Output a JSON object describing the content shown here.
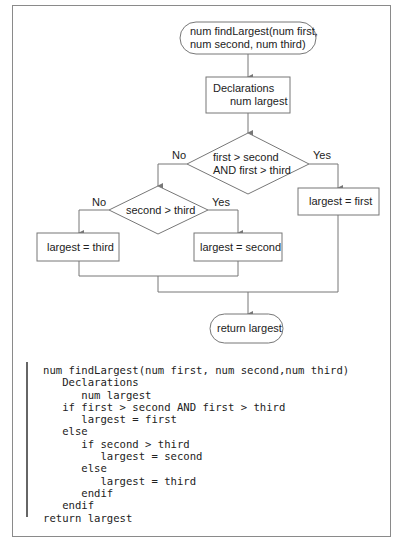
{
  "flowchart": {
    "start_terminal": {
      "line1": "num findLargest(num first,",
      "line2": "num second, num third)"
    },
    "declarations_box": {
      "line1": "Declarations",
      "line2": "num largest"
    },
    "decision1": {
      "line1": "first > second",
      "line2": "AND first > third",
      "no_label": "No",
      "yes_label": "Yes"
    },
    "decision2": {
      "text": "second > third",
      "no_label": "No",
      "yes_label": "Yes"
    },
    "process_first": "largest = first",
    "process_second": "largest = second",
    "process_third": "largest = third",
    "end_terminal": "return largest"
  },
  "pseudocode": {
    "lines": [
      "num findLargest(num first, num second,num third)",
      "   Declarations",
      "      num largest",
      "   if first > second AND first > third",
      "      largest = first",
      "   else",
      "      if second > third",
      "         largest = second",
      "      else",
      "         largest = third",
      "      endif",
      "   endif",
      "return largest"
    ]
  },
  "colors": {
    "line": "#777777",
    "text": "#222222",
    "frame": "#8a8a8a"
  }
}
